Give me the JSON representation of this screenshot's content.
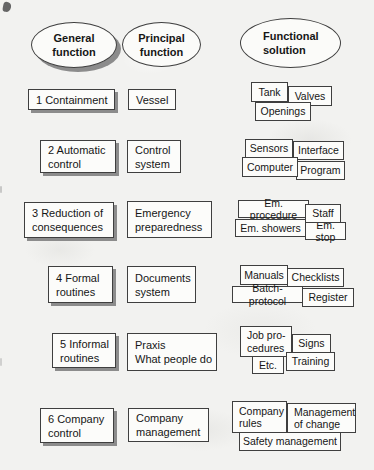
{
  "headers": {
    "general": "General\nfunction",
    "principal": "Principal\nfunction",
    "functional": "Functional\nsolution"
  },
  "rows": [
    {
      "general": "1 Containment",
      "principal": "Vessel",
      "solutions": [
        "Tank",
        "Valves",
        "Openings"
      ]
    },
    {
      "general": "2 Automatic\ncontrol",
      "principal": "Control\nsystem",
      "solutions": [
        "Sensors",
        "Interface",
        "Computer",
        "Program"
      ]
    },
    {
      "general": "3 Reduction of\nconsequences",
      "principal": "Emergency\npreparedness",
      "solutions": [
        "Em. procedure",
        "Staff",
        "Em. showers",
        "Em. stop"
      ]
    },
    {
      "general": "4 Formal\nroutines",
      "principal": "Documents\nsystem",
      "solutions": [
        "Manuals",
        "Checklists",
        "Batch-protocol",
        "Register"
      ]
    },
    {
      "general": "5 Informal\nroutines",
      "principal": "Praxis\nWhat people do",
      "solutions": [
        "Job pro-\ncedures",
        "Signs",
        "Etc.",
        "Training"
      ]
    },
    {
      "general": "6 Company\ncontrol",
      "principal": "Company\nmanagement",
      "solutions": [
        "Company\nrules",
        "Management\nof change",
        "Safety management"
      ]
    }
  ],
  "colors": {
    "page_background": "#f2f2f0",
    "box_background": "#fcfcfa",
    "border": "#3f3f3f",
    "shadow": "#8c8c8c",
    "text": "#161616"
  }
}
